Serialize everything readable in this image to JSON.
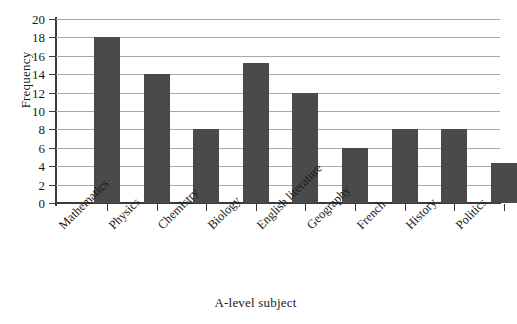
{
  "chart_data": {
    "type": "bar",
    "title": "",
    "xlabel": "A-level subject",
    "ylabel": "Frequency",
    "categories": [
      "Mathematics",
      "Physics",
      "Chemistry",
      "Biology",
      "English literature",
      "Geography",
      "French",
      "History",
      "Politics"
    ],
    "values": [
      18,
      14,
      8,
      15.2,
      12,
      6,
      8,
      8,
      4.3
    ],
    "ylim": [
      0,
      20
    ],
    "ytick_step": 2,
    "yticks": [
      0,
      2,
      4,
      6,
      8,
      10,
      12,
      14,
      16,
      18,
      20
    ],
    "ytick_labels": [
      "0",
      "2",
      "4",
      "6",
      "8",
      "10",
      "12",
      "14",
      "16",
      "18",
      "20"
    ],
    "grid": "horizontal",
    "legend": "none",
    "bar_color": "#4a4a4a",
    "gridline_color": "#a8a8a8",
    "axis_color": "#3a3a3a",
    "background_color": "#ffffff",
    "xtick_label_rotation_degrees": 45
  }
}
